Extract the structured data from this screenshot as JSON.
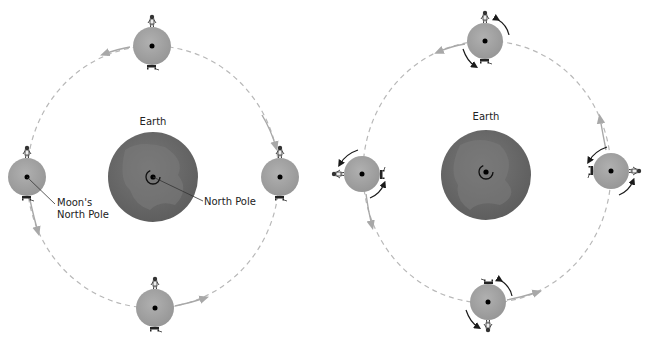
{
  "diagram": {
    "panels": [
      {
        "id": "non-rotating",
        "earth_label": "Earth",
        "earth_pole_label": "North Pole",
        "moon_pole_label_line1": "Moon's",
        "moon_pole_label_line2": "North Pole"
      },
      {
        "id": "synchronous-rotation",
        "earth_label": "Earth"
      }
    ],
    "colors": {
      "earth": "#6b6b6b",
      "earth_land": "#7d7d7d",
      "moon": "#a3a3a3",
      "orbit": "#b5b5b5",
      "ink": "#1a1a1a"
    }
  }
}
